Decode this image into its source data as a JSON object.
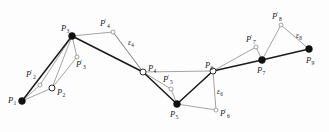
{
  "figure": {
    "background_color": "#fdfdfd",
    "width": 329,
    "height": 132,
    "stroke_dark": "#1a1a1a",
    "stroke_light": "#7d7d7d",
    "marker_fill": "#111111",
    "marker_open_fill": "#ffffff"
  },
  "chart_data": {
    "type": "scatter",
    "title": "",
    "xlabel": "",
    "ylabel": "",
    "grid": false,
    "legend": null,
    "xlim": [
      0,
      329
    ],
    "ylim": [
      0,
      132
    ],
    "nodes": [
      {
        "id": "P1",
        "label": "P",
        "sub": "1",
        "prime": false,
        "marker": "filled",
        "x": 22,
        "y": 101,
        "label_x": 8,
        "label_y": 96
      },
      {
        "id": "P2",
        "label": "P",
        "sub": "2",
        "prime": false,
        "marker": "open",
        "x": 52,
        "y": 88,
        "label_x": 57,
        "label_y": 88
      },
      {
        "id": "P2p",
        "label": "P",
        "sub": "2",
        "prime": true,
        "marker": "open-small",
        "x": 40,
        "y": 85,
        "label_x": 26,
        "label_y": 70
      },
      {
        "id": "P3",
        "label": "P",
        "sub": "3",
        "prime": false,
        "marker": "filled",
        "x": 72,
        "y": 36,
        "label_x": 61,
        "label_y": 24
      },
      {
        "id": "P3p",
        "label": "P",
        "sub": "3",
        "prime": true,
        "marker": "open-small",
        "x": 77,
        "y": 57,
        "label_x": 76,
        "label_y": 60
      },
      {
        "id": "P4",
        "label": "P",
        "sub": "4",
        "prime": false,
        "marker": "open",
        "x": 143,
        "y": 72,
        "label_x": 148,
        "label_y": 64
      },
      {
        "id": "P4p",
        "label": "P",
        "sub": "4",
        "prime": true,
        "marker": "open-small",
        "x": 113,
        "y": 32,
        "label_x": 100,
        "label_y": 19
      },
      {
        "id": "P5",
        "label": "P",
        "sub": "5",
        "prime": false,
        "marker": "filled",
        "x": 177,
        "y": 104,
        "label_x": 170,
        "label_y": 110
      },
      {
        "id": "P5p",
        "label": "P",
        "sub": "5",
        "prime": true,
        "marker": "open-small",
        "x": 171,
        "y": 89,
        "label_x": 163,
        "label_y": 75
      },
      {
        "id": "P6",
        "label": "P",
        "sub": "6",
        "prime": false,
        "marker": "open",
        "x": 213,
        "y": 71,
        "label_x": 205,
        "label_y": 61
      },
      {
        "id": "P6p",
        "label": "P",
        "sub": "6",
        "prime": true,
        "marker": "open-small",
        "x": 216,
        "y": 110,
        "label_x": 220,
        "label_y": 109
      },
      {
        "id": "P7",
        "label": "P",
        "sub": "7",
        "prime": false,
        "marker": "filled",
        "x": 262,
        "y": 60,
        "label_x": 257,
        "label_y": 66
      },
      {
        "id": "P7p",
        "label": "P",
        "sub": "7",
        "prime": true,
        "marker": "open-small",
        "x": 256,
        "y": 47,
        "label_x": 246,
        "label_y": 35
      },
      {
        "id": "P8p",
        "label": "P",
        "sub": "8",
        "prime": true,
        "marker": "open-small",
        "x": 281,
        "y": 25,
        "label_x": 272,
        "label_y": 12
      },
      {
        "id": "P9",
        "label": "P",
        "sub": "9",
        "prime": false,
        "marker": "filled",
        "x": 309,
        "y": 49,
        "label_x": 306,
        "label_y": 56
      }
    ],
    "epsilon_labels": [
      {
        "id": "eps4",
        "label": "ε",
        "sub": "4",
        "x": 128,
        "y": 39
      },
      {
        "id": "eps6",
        "label": "ε",
        "sub": "6",
        "x": 217,
        "y": 88
      },
      {
        "id": "eps8",
        "label": "ε",
        "sub": "8",
        "x": 296,
        "y": 32
      }
    ],
    "dark_path": [
      {
        "from": "P1",
        "to": "P3"
      },
      {
        "from": "P3",
        "to": "P4"
      },
      {
        "from": "P4",
        "to": "P5"
      },
      {
        "from": "P5",
        "to": "P6"
      },
      {
        "from": "P6",
        "to": "P7"
      },
      {
        "from": "P7",
        "to": "P9"
      }
    ],
    "light_edges": [
      {
        "from": "P1",
        "to": "P2"
      },
      {
        "from": "P2",
        "to": "P3"
      },
      {
        "from": "P1",
        "to": "P2p"
      },
      {
        "from": "P2p",
        "to": "P3"
      },
      {
        "from": "P3",
        "to": "P3p"
      },
      {
        "from": "P3p",
        "to": "P2"
      },
      {
        "from": "P3",
        "to": "P4p"
      },
      {
        "from": "P4p",
        "to": "P4"
      },
      {
        "from": "P4",
        "to": "P4p"
      },
      {
        "from": "P4",
        "to": "P5p"
      },
      {
        "from": "P5p",
        "to": "P5"
      },
      {
        "from": "P5",
        "to": "P6"
      },
      {
        "from": "P4",
        "to": "P6"
      },
      {
        "from": "P6",
        "to": "P6p"
      },
      {
        "from": "P6p",
        "to": "P5"
      },
      {
        "from": "P6",
        "to": "P7p"
      },
      {
        "from": "P7p",
        "to": "P7"
      },
      {
        "from": "P7",
        "to": "P8p"
      },
      {
        "from": "P8p",
        "to": "P9"
      }
    ]
  }
}
